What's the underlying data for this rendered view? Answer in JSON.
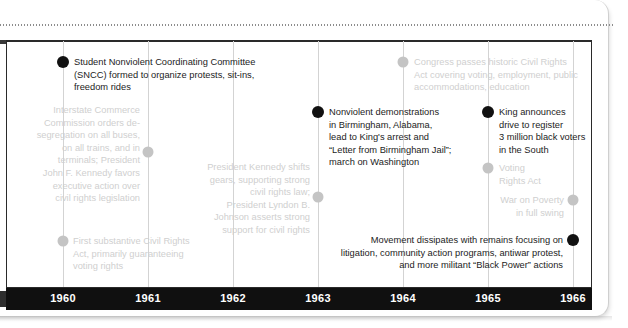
{
  "figure": {
    "type": "timeline",
    "title": "",
    "axis": {
      "years": [
        "1960",
        "1961",
        "1962",
        "1963",
        "1964",
        "1965",
        "1966"
      ],
      "bar_color": "#101010",
      "label_color": "#ffffff"
    },
    "colors": {
      "dot_highlight": "#111111",
      "dot_muted": "#c4c4c4",
      "text_highlight": "#1c1c1c",
      "text_muted": "#cfcfcf",
      "gridline": "#d3d3d3",
      "frame": "#2a2a2a"
    },
    "events": [
      {
        "id": "sncc-1960",
        "year": "1960",
        "emphasis": "highlight",
        "align": "left",
        "text": "Student Nonviolent Coordinating Committee\n(SNCC) formed to organize protests, sit-ins,\nfreedom rides"
      },
      {
        "id": "icc-desegregation-1961",
        "year": "1961",
        "emphasis": "muted",
        "align": "right",
        "text": "Interstate Commerce\nCommission orders de-\nsegregation on all buses,\non all trains, and in\nterminals; President\nJohn F. Kennedy favors\nexecutive action over\ncivil rights legislation"
      },
      {
        "id": "first-civil-rights-act-1960",
        "year": "1960",
        "emphasis": "muted",
        "align": "left",
        "text": "First substantive Civil Rights\nAct, primarily guaranteeing\nvoting rights"
      },
      {
        "id": "kennedy-johnson-1963",
        "year": "1963",
        "emphasis": "muted",
        "align": "right",
        "text": "President Kennedy shifts\ngears, supporting strong\ncivil rights law;\nPresident Lyndon B.\nJohnson asserts strong\nsupport for civil rights"
      },
      {
        "id": "birmingham-1963",
        "year": "1963",
        "emphasis": "highlight",
        "align": "left",
        "text": "Nonviolent demonstrations\nin Birmingham, Alabama,\nlead to King's arrest and\n“Letter from Birmingham Jail”;\nmarch on Washington"
      },
      {
        "id": "civil-rights-act-1964",
        "year": "1964",
        "emphasis": "muted",
        "align": "left",
        "text": "Congress passes historic Civil Rights\nAct covering voting, employment, public\naccommodations, education"
      },
      {
        "id": "king-voter-drive-1965",
        "year": "1965",
        "emphasis": "highlight",
        "align": "left",
        "text": "King announces\ndrive to register\n3 million black voters\nin the South"
      },
      {
        "id": "voting-rights-act-1965",
        "year": "1965",
        "emphasis": "muted",
        "align": "left",
        "text": "Voting\nRights Act"
      },
      {
        "id": "war-on-poverty-1966",
        "year": "1966",
        "emphasis": "muted",
        "align": "right",
        "text": "War on Poverty\nin full swing"
      },
      {
        "id": "movement-dissipates-1966",
        "year": "1966",
        "emphasis": "highlight",
        "align": "right",
        "text": "Movement dissipates with remains focusing on\nlitigation, community action programs, antiwar protest,\nand more militant “Black Power” actions"
      }
    ]
  }
}
